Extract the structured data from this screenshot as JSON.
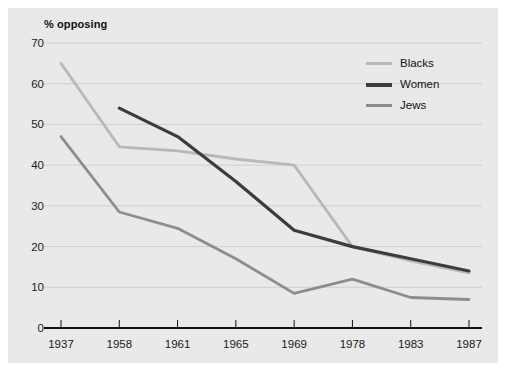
{
  "chart_data": {
    "type": "line",
    "title": "",
    "ylabel": "% opposing",
    "xlabel": "",
    "categories": [
      "1937",
      "1958",
      "1961",
      "1965",
      "1969",
      "1978",
      "1983",
      "1987"
    ],
    "ylim": [
      0,
      70
    ],
    "ytick_step": 10,
    "yticks": [
      "0",
      "10",
      "20",
      "30",
      "40",
      "50",
      "60",
      "70"
    ],
    "grid": "horizontal",
    "legend_position": "top-right",
    "series": [
      {
        "name": "Blacks",
        "color": "#b8b8b8",
        "values": [
          65,
          44.5,
          43.5,
          41.5,
          40,
          20,
          16.5,
          13.5
        ]
      },
      {
        "name": "Women",
        "color": "#3c3c3c",
        "values": [
          null,
          54,
          47,
          36,
          24,
          20,
          17,
          14
        ]
      },
      {
        "name": "Jews",
        "color": "#8d8d8d",
        "values": [
          47,
          28.5,
          24.5,
          17,
          8.5,
          12,
          7.5,
          7
        ]
      }
    ]
  },
  "axis": {
    "y_title": "% opposing"
  }
}
